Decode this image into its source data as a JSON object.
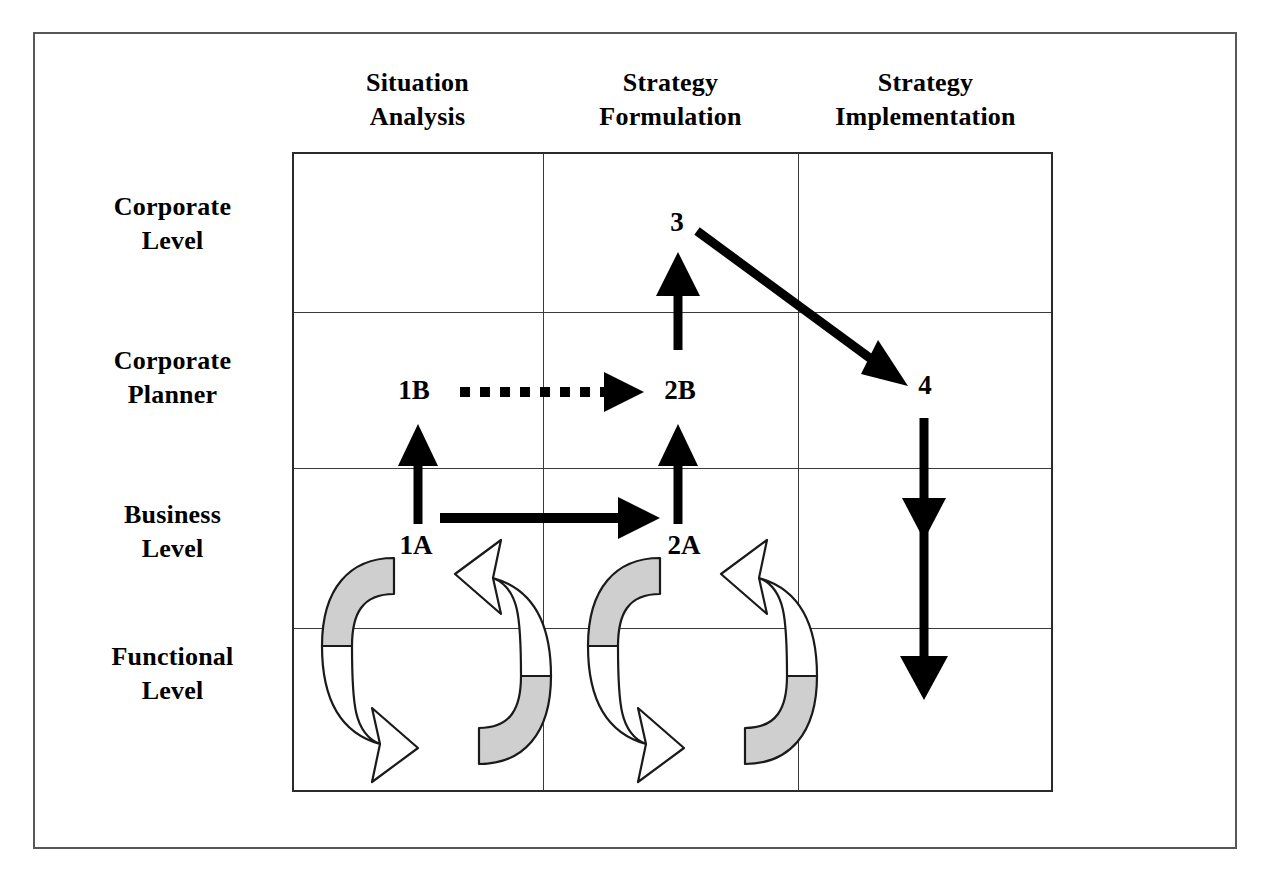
{
  "figure": {
    "type": "matrix-process-diagram"
  },
  "columns": [
    {
      "id": "situation-analysis",
      "line1": "Situation",
      "line2": "Analysis"
    },
    {
      "id": "strategy-formulation",
      "line1": "Strategy",
      "line2": "Formulation"
    },
    {
      "id": "strategy-implementation",
      "line1": "Strategy",
      "line2": "Implementation"
    }
  ],
  "rows": [
    {
      "id": "corporate-level",
      "line1": "Corporate",
      "line2": "Level"
    },
    {
      "id": "corporate-planner",
      "line1": "Corporate",
      "line2": "Planner"
    },
    {
      "id": "business-level",
      "line1": "Business",
      "line2": "Level"
    },
    {
      "id": "functional-level",
      "line1": "Functional",
      "line2": "Level"
    }
  ],
  "nodes": [
    {
      "id": "node-1b",
      "label": "1B",
      "row": "corporate-planner",
      "column": "situation-analysis"
    },
    {
      "id": "node-2b",
      "label": "2B",
      "row": "corporate-planner",
      "column": "strategy-formulation"
    },
    {
      "id": "node-3",
      "label": "3",
      "row": "corporate-level",
      "column": "strategy-formulation"
    },
    {
      "id": "node-4",
      "label": "4",
      "row": "corporate-planner",
      "column": "strategy-implementation"
    },
    {
      "id": "node-1a",
      "label": "1A",
      "row": "business-level",
      "column": "situation-analysis"
    },
    {
      "id": "node-2a",
      "label": "2A",
      "row": "business-level",
      "column": "strategy-formulation"
    }
  ],
  "connectors": [
    {
      "id": "arrow-1a-to-1b",
      "from": "1A",
      "to": "1B",
      "style": "solid",
      "direction": "up"
    },
    {
      "id": "arrow-1a-to-2a",
      "from": "1A",
      "to": "2A",
      "style": "solid",
      "direction": "right"
    },
    {
      "id": "arrow-1b-to-2b",
      "from": "1B",
      "to": "2B",
      "style": "dotted",
      "direction": "right"
    },
    {
      "id": "arrow-2a-to-2b",
      "from": "2A",
      "to": "2B",
      "style": "solid",
      "direction": "up"
    },
    {
      "id": "arrow-2b-to-3",
      "from": "2B",
      "to": "3",
      "style": "solid",
      "direction": "up"
    },
    {
      "id": "arrow-3-to-4",
      "from": "3",
      "to": "4",
      "style": "solid",
      "direction": "diagonal-down-right"
    },
    {
      "id": "arrow-4-down",
      "from": "4",
      "to": "Functional Level",
      "style": "solid",
      "direction": "down",
      "arrowheads": 2
    }
  ],
  "cycles": [
    {
      "id": "cycle-situation-analysis",
      "column": "situation-analysis",
      "between": [
        "Business Level",
        "Functional Level"
      ]
    },
    {
      "id": "cycle-strategy-formulation",
      "column": "strategy-formulation",
      "between": [
        "Business Level",
        "Functional Level"
      ]
    }
  ],
  "colors": {
    "ink": "#000000",
    "grid_line": "#3a3a3d",
    "grid_border": "#2b2b2e",
    "page_border": "#57575a",
    "cycle_fill_shaded": "#cfcfcf",
    "cycle_fill_open": "#ffffff",
    "background": "#ffffff"
  }
}
